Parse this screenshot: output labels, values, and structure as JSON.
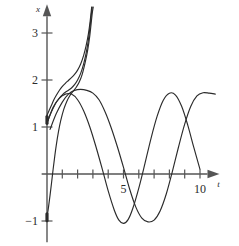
{
  "figure": {
    "name": "solution-curves-plot",
    "background": "#ffffff",
    "line_color": "#2b2b2b",
    "axis_color": "#555555"
  },
  "axes": {
    "vertical": {
      "name": "x-axis",
      "label": "x",
      "tick_values": [
        -1,
        1,
        2,
        3
      ],
      "tick_labels": [
        "−1",
        "1",
        "2",
        "3"
      ],
      "arrow": true,
      "range": [
        -1.45,
        3.55
      ]
    },
    "horizontal": {
      "name": "t-axis",
      "label": "t",
      "tick_values": [
        1,
        2,
        3,
        4,
        5,
        6,
        7,
        8,
        9,
        10
      ],
      "labeled_ticks": [
        {
          "value": 5,
          "text": "5"
        },
        {
          "value": 10,
          "text": "10"
        }
      ],
      "arrow": true,
      "range": [
        -0.35,
        11.6
      ]
    }
  },
  "markers": [
    {
      "name": "initial-condition-marker-upper",
      "t": 0,
      "x": 1.15
    },
    {
      "name": "initial-condition-marker-lower",
      "t": 0,
      "x": -0.92
    }
  ],
  "chart_data": {
    "type": "line",
    "title": "",
    "xlabel": "t",
    "ylabel": "x",
    "xlim": [
      -0.35,
      11.6
    ],
    "ylim": [
      -1.45,
      3.55
    ],
    "grid": false,
    "legend": "none",
    "xticks": [
      1,
      2,
      3,
      4,
      5,
      6,
      7,
      8,
      9,
      10
    ],
    "xticklabels": [
      "",
      "",
      "",
      "",
      "5",
      "",
      "",
      "",
      "",
      "10"
    ],
    "yticks": [
      -1,
      1,
      2,
      3
    ],
    "yticklabels": [
      "−1",
      "1",
      "2",
      "3"
    ],
    "series": [
      {
        "name": "blowup-curve-outer",
        "comment": "rises from x=1.25 at t=0, bends upward and escapes top of frame near t=2.9",
        "points": [
          [
            0.0,
            1.25
          ],
          [
            0.15,
            1.36
          ],
          [
            0.3,
            1.47
          ],
          [
            0.45,
            1.58
          ],
          [
            0.6,
            1.67
          ],
          [
            0.75,
            1.75
          ],
          [
            0.9,
            1.82
          ],
          [
            1.05,
            1.88
          ],
          [
            1.2,
            1.93
          ],
          [
            1.4,
            1.99
          ],
          [
            1.6,
            2.05
          ],
          [
            1.8,
            2.12
          ],
          [
            2.0,
            2.21
          ],
          [
            2.2,
            2.34
          ],
          [
            2.4,
            2.53
          ],
          [
            2.55,
            2.72
          ],
          [
            2.7,
            2.97
          ],
          [
            2.82,
            3.25
          ],
          [
            2.92,
            3.55
          ]
        ]
      },
      {
        "name": "blowup-curve-inner",
        "comment": "starts x=1.10 at t=0, tracks slightly below then merges into the steep rise",
        "points": [
          [
            0.0,
            1.1
          ],
          [
            0.15,
            1.22
          ],
          [
            0.3,
            1.33
          ],
          [
            0.45,
            1.43
          ],
          [
            0.6,
            1.52
          ],
          [
            0.75,
            1.59
          ],
          [
            0.9,
            1.65
          ],
          [
            1.05,
            1.7
          ],
          [
            1.2,
            1.74
          ],
          [
            1.4,
            1.78
          ],
          [
            1.6,
            1.83
          ],
          [
            1.8,
            1.9
          ],
          [
            2.0,
            2.0
          ],
          [
            2.2,
            2.14
          ],
          [
            2.4,
            2.35
          ],
          [
            2.55,
            2.56
          ],
          [
            2.7,
            2.84
          ],
          [
            2.82,
            3.16
          ],
          [
            2.95,
            3.55
          ]
        ]
      },
      {
        "name": "rising-curve-from-below",
        "comment": "starts near x=-0.92 at t=0, rises steeply through the origin region and escapes top near t=3.0",
        "points": [
          [
            0.0,
            -0.92
          ],
          [
            0.1,
            -0.7
          ],
          [
            0.2,
            -0.45
          ],
          [
            0.3,
            -0.18
          ],
          [
            0.4,
            0.1
          ],
          [
            0.5,
            0.36
          ],
          [
            0.6,
            0.6
          ],
          [
            0.75,
            0.9
          ],
          [
            0.9,
            1.14
          ],
          [
            1.1,
            1.38
          ],
          [
            1.3,
            1.55
          ],
          [
            1.5,
            1.67
          ],
          [
            1.7,
            1.76
          ],
          [
            1.9,
            1.84
          ],
          [
            2.1,
            1.95
          ],
          [
            2.3,
            2.12
          ],
          [
            2.5,
            2.38
          ],
          [
            2.65,
            2.62
          ],
          [
            2.8,
            2.95
          ],
          [
            2.95,
            3.4
          ],
          [
            3.02,
            3.55
          ]
        ]
      },
      {
        "name": "oscillating-curve-a",
        "comment": "sinusoid peaking x~1.70 near t=1.6, trough x~-1.05 near t=4.8, peak x~1.72 near t=7.9",
        "points": [
          [
            0.05,
            1.12
          ],
          [
            0.4,
            1.42
          ],
          [
            0.8,
            1.61
          ],
          [
            1.2,
            1.7
          ],
          [
            1.6,
            1.7
          ],
          [
            2.0,
            1.58
          ],
          [
            2.4,
            1.34
          ],
          [
            2.8,
            1.0
          ],
          [
            3.2,
            0.58
          ],
          [
            3.6,
            0.12
          ],
          [
            4.0,
            -0.36
          ],
          [
            4.4,
            -0.77
          ],
          [
            4.7,
            -0.98
          ],
          [
            5.0,
            -1.05
          ],
          [
            5.3,
            -0.97
          ],
          [
            5.6,
            -0.74
          ],
          [
            6.0,
            -0.3
          ],
          [
            6.4,
            0.22
          ],
          [
            6.8,
            0.76
          ],
          [
            7.2,
            1.23
          ],
          [
            7.6,
            1.57
          ],
          [
            8.0,
            1.72
          ],
          [
            8.4,
            1.68
          ],
          [
            8.8,
            1.44
          ],
          [
            9.2,
            1.04
          ],
          [
            9.6,
            0.56
          ],
          [
            10.0,
            0.1
          ]
        ]
      },
      {
        "name": "oscillating-curve-b",
        "comment": "sinusoid shifted right: peak x~1.80 near t=3.0, trough x~-1.02 near t=7.6, rising again toward t=11",
        "points": [
          [
            0.2,
            0.95
          ],
          [
            0.6,
            1.28
          ],
          [
            1.0,
            1.53
          ],
          [
            1.4,
            1.7
          ],
          [
            1.8,
            1.78
          ],
          [
            2.2,
            1.8
          ],
          [
            2.6,
            1.78
          ],
          [
            3.0,
            1.72
          ],
          [
            3.4,
            1.58
          ],
          [
            3.8,
            1.32
          ],
          [
            4.2,
            0.98
          ],
          [
            4.6,
            0.58
          ],
          [
            5.0,
            0.14
          ],
          [
            5.4,
            -0.32
          ],
          [
            5.8,
            -0.7
          ],
          [
            6.2,
            -0.94
          ],
          [
            6.6,
            -1.02
          ],
          [
            7.0,
            -0.98
          ],
          [
            7.4,
            -0.78
          ],
          [
            7.8,
            -0.42
          ],
          [
            8.2,
            0.06
          ],
          [
            8.6,
            0.58
          ],
          [
            9.0,
            1.06
          ],
          [
            9.4,
            1.44
          ],
          [
            9.8,
            1.66
          ],
          [
            10.2,
            1.73
          ],
          [
            10.6,
            1.72
          ],
          [
            11.0,
            1.7
          ]
        ]
      }
    ]
  }
}
